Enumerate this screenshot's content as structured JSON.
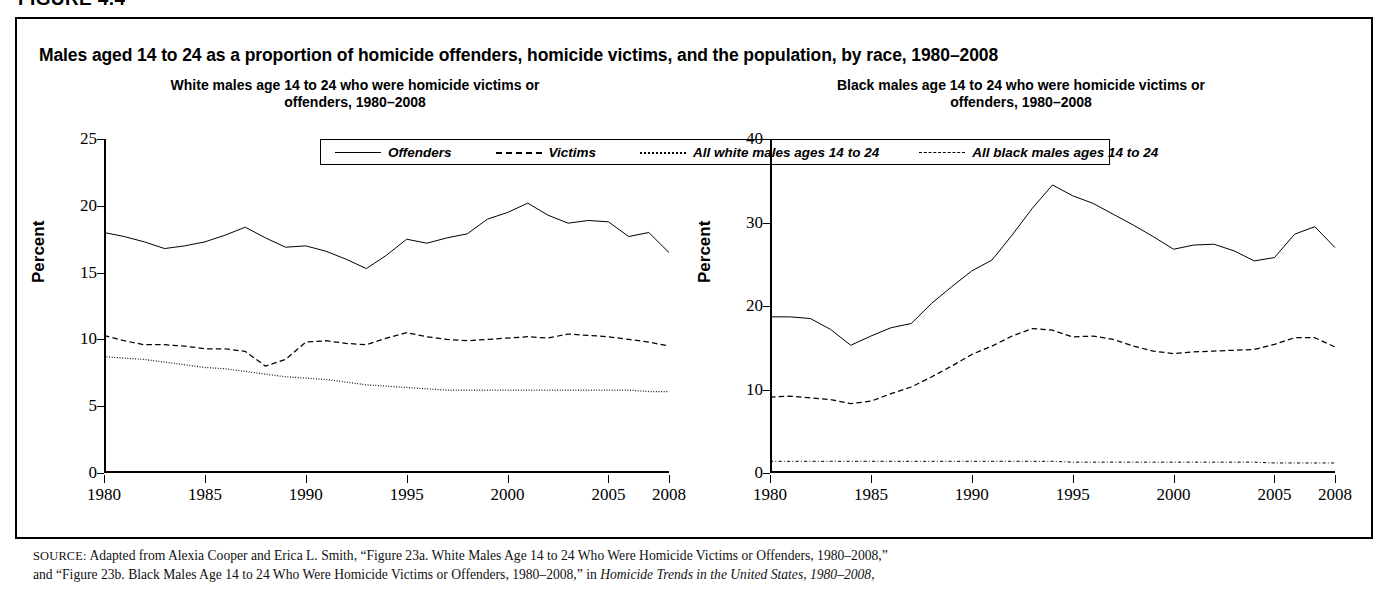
{
  "figure": {
    "label": "FIGURE 4.4",
    "title": "Males aged 14 to 24 as a proportion of homicide offenders, homicide victims, and the population, by race, 1980–2008"
  },
  "legend": {
    "items": [
      {
        "label": "Offenders",
        "style": "solid",
        "icon": "solid-line-icon"
      },
      {
        "label": "Victims",
        "style": "dashed",
        "icon": "dashed-line-icon"
      },
      {
        "label": "All white males ages 14 to 24",
        "style": "dotted",
        "icon": "dotted-line-icon"
      },
      {
        "label": "All black males ages 14 to 24",
        "style": "dashdot",
        "icon": "dash-dot-line-icon"
      }
    ]
  },
  "source": {
    "prefix": "SOURCE:",
    "line1": "Adapted from Alexia Cooper and Erica L. Smith, “Figure 23a. White Males Age 14 to 24 Who Were Homicide Victims or Offenders, 1980–2008,”",
    "line2_a": "and “Figure 23b. Black Males Age 14 to 24 Who Were Homicide Victims or Offenders, 1980–2008,” in ",
    "line2_italic": "Homicide Trends in the United States, 1980–2008,"
  },
  "chart_data": [
    {
      "type": "line",
      "panel_id": "white",
      "title": "White males age 14 to 24 who were homicide victims or offenders, 1980–2008",
      "xlabel": "",
      "ylabel": "Percent",
      "ylim": [
        0,
        25
      ],
      "yticks": [
        0,
        5,
        10,
        15,
        20,
        25
      ],
      "xlim": [
        1980,
        2008
      ],
      "xticks": [
        1980,
        1985,
        1990,
        1995,
        2000,
        2005,
        2008
      ],
      "grid": false,
      "legend_position": "top-shared",
      "x": [
        1980,
        1981,
        1982,
        1983,
        1984,
        1985,
        1986,
        1987,
        1988,
        1989,
        1990,
        1991,
        1992,
        1993,
        1994,
        1995,
        1996,
        1997,
        1998,
        1999,
        2000,
        2001,
        2002,
        2003,
        2004,
        2005,
        2006,
        2007,
        2008
      ],
      "series": [
        {
          "name": "Offenders",
          "style": "solid",
          "values": [
            18.0,
            17.7,
            17.3,
            16.8,
            17.0,
            17.3,
            17.8,
            18.4,
            17.6,
            16.9,
            17.0,
            16.6,
            16.0,
            15.3,
            16.3,
            17.5,
            17.2,
            17.6,
            17.9,
            19.0,
            19.5,
            20.2,
            19.3,
            18.7,
            18.9,
            18.8,
            17.7,
            18.0,
            16.5
          ]
        },
        {
          "name": "Victims",
          "style": "dashed",
          "values": [
            10.3,
            9.9,
            9.6,
            9.6,
            9.5,
            9.3,
            9.3,
            9.1,
            8.0,
            8.5,
            9.8,
            9.9,
            9.7,
            9.6,
            10.1,
            10.5,
            10.2,
            10.0,
            9.9,
            10.0,
            10.1,
            10.2,
            10.1,
            10.4,
            10.3,
            10.2,
            10.0,
            9.8,
            9.5
          ]
        },
        {
          "name": "All white males ages 14 to 24",
          "style": "dotted",
          "values": [
            8.7,
            8.6,
            8.5,
            8.3,
            8.1,
            7.9,
            7.8,
            7.6,
            7.4,
            7.2,
            7.1,
            7.0,
            6.8,
            6.6,
            6.5,
            6.4,
            6.3,
            6.2,
            6.2,
            6.2,
            6.2,
            6.2,
            6.2,
            6.2,
            6.2,
            6.2,
            6.2,
            6.1,
            6.1
          ]
        }
      ]
    },
    {
      "type": "line",
      "panel_id": "black",
      "title": "Black males age 14 to 24 who were homicide victims or offenders, 1980–2008",
      "xlabel": "",
      "ylabel": "Percent",
      "ylim": [
        0,
        40
      ],
      "yticks": [
        0,
        10,
        20,
        30,
        40
      ],
      "xlim": [
        1980,
        2008
      ],
      "xticks": [
        1980,
        1985,
        1990,
        1995,
        2000,
        2005,
        2008
      ],
      "grid": false,
      "legend_position": "top-shared",
      "x": [
        1980,
        1981,
        1982,
        1983,
        1984,
        1985,
        1986,
        1987,
        1988,
        1989,
        1990,
        1991,
        1992,
        1993,
        1994,
        1995,
        1996,
        1997,
        1998,
        1999,
        2000,
        2001,
        2002,
        2003,
        2004,
        2005,
        2006,
        2007,
        2008
      ],
      "series": [
        {
          "name": "Offenders",
          "style": "solid",
          "values": [
            18.7,
            18.7,
            18.5,
            17.2,
            15.3,
            16.4,
            17.4,
            17.9,
            20.3,
            22.3,
            24.2,
            25.5,
            28.5,
            31.7,
            34.5,
            33.2,
            32.3,
            31.0,
            29.7,
            28.3,
            26.8,
            27.3,
            27.4,
            26.6,
            25.4,
            25.8,
            28.6,
            29.5,
            27.0
          ]
        },
        {
          "name": "Victims",
          "style": "dashed",
          "values": [
            9.1,
            9.2,
            9.0,
            8.8,
            8.3,
            8.6,
            9.5,
            10.3,
            11.5,
            12.8,
            14.2,
            15.2,
            16.4,
            17.3,
            17.1,
            16.3,
            16.4,
            16.0,
            15.2,
            14.6,
            14.3,
            14.5,
            14.6,
            14.7,
            14.8,
            15.4,
            16.2,
            16.2,
            15.1
          ]
        },
        {
          "name": "All black males ages 14 to 24",
          "style": "dashdot",
          "values": [
            1.4,
            1.4,
            1.4,
            1.4,
            1.4,
            1.4,
            1.4,
            1.4,
            1.4,
            1.4,
            1.4,
            1.4,
            1.4,
            1.4,
            1.4,
            1.3,
            1.3,
            1.3,
            1.3,
            1.3,
            1.3,
            1.3,
            1.3,
            1.3,
            1.3,
            1.2,
            1.2,
            1.2,
            1.2
          ]
        }
      ]
    }
  ]
}
